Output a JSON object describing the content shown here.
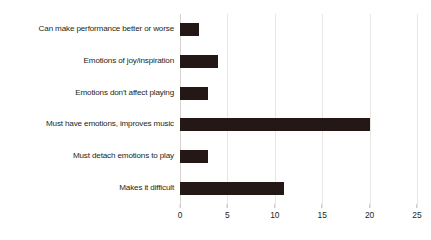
{
  "chart_data": {
    "type": "bar",
    "orientation": "horizontal",
    "title": "",
    "subtitle": "",
    "xlabel": "",
    "ylabel": "",
    "categories": [
      "Can make performance better or worse",
      "Emotions of joy/inspiration",
      "Emotions don't affect playing",
      "Must have emotions, improves music",
      "Must detach emotions to play",
      "Makes it difficult"
    ],
    "values": [
      2,
      4,
      3,
      20,
      3,
      11
    ],
    "xlim": [
      0,
      25
    ],
    "xticks": [
      0,
      5,
      10,
      15,
      20,
      25
    ],
    "xtick_labels": [
      "0",
      "5",
      "10",
      "15",
      "20",
      "25"
    ],
    "grid": true,
    "grid_axis": "x",
    "legend": false,
    "bar_color": "#231815",
    "grid_color": "#e8e6e1",
    "text_color": "#231f20",
    "background_color": "#ffffff"
  }
}
